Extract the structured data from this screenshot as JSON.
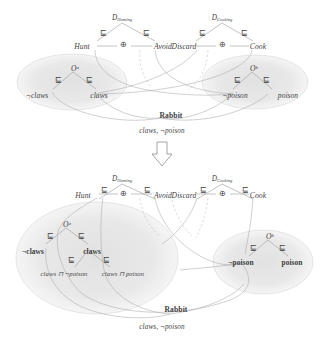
{
  "figure": {
    "colors": {
      "text": "#3f3f3f",
      "line": "#8c8c8c",
      "ellipse_fill": "#e3e3e3",
      "ellipse_stroke": "#bdbdbd",
      "background": "#ffffff"
    },
    "transform_arrow": "downward-block-arrow"
  },
  "top_diagram": {
    "domains": [
      {
        "name": "D",
        "subscript": "Hunting"
      },
      {
        "name": "D",
        "subscript": "Cooking"
      }
    ],
    "actions": [
      {
        "label": "Hunt"
      },
      {
        "label": "Avoid"
      },
      {
        "label": "Discard"
      },
      {
        "label": "Cook"
      }
    ],
    "operators": [
      {
        "symbol": "⊕"
      },
      {
        "symbol": "⊕"
      }
    ],
    "ontologies": [
      {
        "name": "O",
        "superscript": "a"
      },
      {
        "name": "O",
        "superscript": "b"
      }
    ],
    "concepts": [
      {
        "label": "¬claws"
      },
      {
        "label": "claws"
      },
      {
        "label": "¬poison"
      },
      {
        "label": "poison"
      }
    ],
    "subsumption_symbol": "⊑",
    "individual": {
      "label": "Rabbit"
    },
    "assertions": {
      "label": "claws, ¬poison"
    }
  },
  "bottom_diagram": {
    "domains": [
      {
        "name": "D",
        "subscript": "Hunting"
      },
      {
        "name": "D",
        "subscript": "Cooking"
      }
    ],
    "actions": [
      {
        "label": "Hunt"
      },
      {
        "label": "Avoid"
      },
      {
        "label": "Discard"
      },
      {
        "label": "Cook"
      }
    ],
    "operators": [
      {
        "symbol": "⊕"
      },
      {
        "symbol": "⊕"
      }
    ],
    "ontologies": [
      {
        "name": "O",
        "superscript": "a"
      },
      {
        "name": "O",
        "superscript": "b"
      }
    ],
    "concepts": [
      {
        "label": "¬claws"
      },
      {
        "label": "claws"
      },
      {
        "label": "¬poison"
      },
      {
        "label": "poison"
      }
    ],
    "refined_concepts": [
      {
        "label": "claws ⊓ ¬poison"
      },
      {
        "label": "claws ⊓ poison"
      }
    ],
    "subsumption_symbol": "⊑",
    "individual": {
      "label": "Rabbit"
    },
    "assertions": {
      "label": "claws, ¬poison"
    }
  }
}
